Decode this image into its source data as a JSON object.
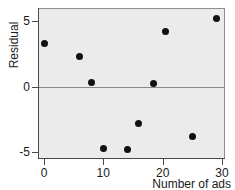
{
  "chart_data": {
    "type": "scatter",
    "title": "",
    "xlabel": "Number of ads",
    "ylabel": "Residual",
    "xlim": [
      -1.5,
      31.5
    ],
    "ylim": [
      -5.7,
      6.1
    ],
    "grid": false,
    "legend": null,
    "xticks": [
      0,
      10,
      20,
      30
    ],
    "xticklabels": [
      "0",
      "10",
      "20",
      "30"
    ],
    "yticks": [
      5,
      0,
      -5
    ],
    "yticklabels": [
      "5",
      "0",
      "-5"
    ],
    "reference_line": {
      "orientation": "horizontal",
      "value": 0
    },
    "marker": {
      "shape": "circle",
      "color": "#111111",
      "size": 7
    },
    "panel_background": "#ebebeb",
    "x": [
      0,
      6,
      8,
      10,
      14,
      16,
      18.5,
      20.5,
      25,
      29
    ],
    "y": [
      3.3,
      2.3,
      0.3,
      -4.7,
      -4.8,
      -2.8,
      0.2,
      4.2,
      -3.8,
      5.2
    ],
    "points": [
      {
        "x": 0,
        "y": 3.3
      },
      {
        "x": 6,
        "y": 2.3
      },
      {
        "x": 8,
        "y": 0.3
      },
      {
        "x": 10,
        "y": -4.7
      },
      {
        "x": 14,
        "y": -4.8
      },
      {
        "x": 16,
        "y": -2.8
      },
      {
        "x": 18.5,
        "y": 0.2
      },
      {
        "x": 20.5,
        "y": 4.2
      },
      {
        "x": 25,
        "y": -3.8
      },
      {
        "x": 29,
        "y": 5.2
      }
    ]
  },
  "axes": {
    "y_title": "Residual",
    "x_title": "Number of ads"
  }
}
